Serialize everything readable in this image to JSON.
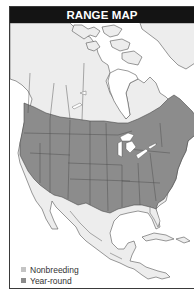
{
  "title": "RANGE MAP",
  "legend": {
    "items": [
      {
        "label": "Nonbreeding",
        "color": "#c4c4c4"
      },
      {
        "label": "Year-round",
        "color": "#8c8c8c"
      }
    ]
  },
  "colors": {
    "header_bg": "#141414",
    "year_round": "#8c8c8c",
    "land": "#ededed",
    "water": "#ffffff",
    "boundary": "#555555"
  },
  "map": {
    "region": "North America",
    "ranges": [
      {
        "type": "year-round",
        "extent": "Southern Canada and most of the contiguous United States"
      },
      {
        "type": "unshaded",
        "extent": "Northern Canada, Alaska, Greenland, Mexico, Central America, Caribbean"
      }
    ]
  }
}
